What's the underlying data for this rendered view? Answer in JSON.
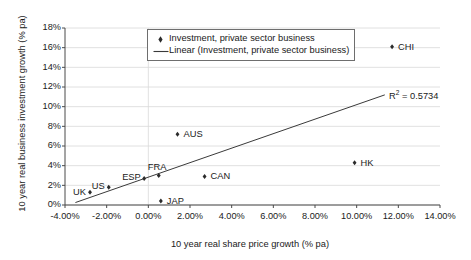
{
  "chart_data": {
    "type": "scatter",
    "title": "",
    "xlabel": "10 year real share price growth (% pa)",
    "ylabel": "10 year real business investment growth (% pa)",
    "xlim": [
      -4,
      14
    ],
    "ylim": [
      0,
      18
    ],
    "xticks": [
      "-4.00%",
      "-2.00%",
      "0.00%",
      "2.00%",
      "4.00%",
      "6.00%",
      "8.00%",
      "10.00%",
      "12.00%",
      "14.00%"
    ],
    "xtick_values": [
      -4,
      -2,
      0,
      2,
      4,
      6,
      8,
      10,
      12,
      14
    ],
    "yticks": [
      "0%",
      "2%",
      "4%",
      "6%",
      "8%",
      "10%",
      "12%",
      "14%",
      "16%",
      "18%"
    ],
    "ytick_values": [
      0,
      2,
      4,
      6,
      8,
      10,
      12,
      14,
      16,
      18
    ],
    "grid": true,
    "legend_position": "top-center",
    "series": [
      {
        "name": "Investment, private sector business",
        "marker": "diamond",
        "color": "#2b2b2b",
        "points": [
          {
            "label": "UK",
            "x": -2.8,
            "y": 1.3,
            "label_dx": -17,
            "label_dy": -4
          },
          {
            "label": "US",
            "x": -1.9,
            "y": 1.8,
            "label_dx": -17,
            "label_dy": -5
          },
          {
            "label": "ESP",
            "x": -0.2,
            "y": 2.7,
            "label_dx": -22,
            "label_dy": -5
          },
          {
            "label": "FRA",
            "x": 0.5,
            "y": 3.0,
            "label_dx": -11,
            "label_dy": -13
          },
          {
            "label": "JAP",
            "x": 0.6,
            "y": 0.4,
            "label_dx": 6,
            "label_dy": -4
          },
          {
            "label": "AUS",
            "x": 1.4,
            "y": 7.2,
            "label_dx": 6,
            "label_dy": -4
          },
          {
            "label": "CAN",
            "x": 2.7,
            "y": 2.9,
            "label_dx": 6,
            "label_dy": -4
          },
          {
            "label": "HK",
            "x": 9.9,
            "y": 4.3,
            "label_dx": 6,
            "label_dy": -4
          },
          {
            "label": "CHI",
            "x": 11.7,
            "y": 16.1,
            "label_dx": 6,
            "label_dy": -4
          }
        ]
      }
    ],
    "trendline": {
      "name": "Linear (Investment, private sector business)",
      "color": "#3a3a3a",
      "x_start": -3.5,
      "y_start": 0.25,
      "x_end": 11.35,
      "y_end": 11.2,
      "r_squared": 0.5734
    },
    "annotations": [
      {
        "name": "r-squared",
        "prefix": "R",
        "sup": "2",
        "suffix": " = 0.5734"
      }
    ]
  },
  "legend": {
    "entries": [
      {
        "key": "diamond-marker",
        "label": "Investment, private sector business"
      },
      {
        "key": "line-marker",
        "label": "Linear (Investment, private sector business)"
      }
    ]
  }
}
